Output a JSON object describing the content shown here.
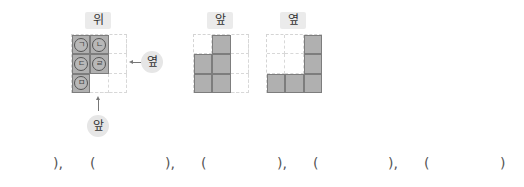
{
  "views": {
    "top": {
      "label": "위",
      "grid": [
        [
          {
            "filled": true,
            "mark": "ㄱ"
          },
          {
            "filled": true,
            "mark": "ㄴ"
          },
          {
            "filled": false,
            "mark": ""
          }
        ],
        [
          {
            "filled": true,
            "mark": "ㄷ"
          },
          {
            "filled": true,
            "mark": "ㄹ"
          },
          {
            "filled": false,
            "mark": ""
          }
        ],
        [
          {
            "filled": true,
            "mark": "ㅁ"
          },
          {
            "filled": false,
            "mark": ""
          },
          {
            "filled": false,
            "mark": ""
          }
        ]
      ],
      "side_pointer_label": "옆",
      "front_pointer_label": "앞"
    },
    "front": {
      "label": "앞",
      "grid": [
        [
          false,
          true,
          false
        ],
        [
          true,
          true,
          false
        ],
        [
          true,
          true,
          false
        ]
      ]
    },
    "side": {
      "label": "옆",
      "grid": [
        [
          false,
          false,
          true
        ],
        [
          false,
          false,
          true
        ],
        [
          true,
          true,
          true
        ]
      ]
    }
  },
  "answers": {
    "items": [
      {
        "close": "),",
        "mark": "ㄴ",
        "open": "("
      },
      {
        "close": "),",
        "mark": "ㄷ",
        "open": "("
      },
      {
        "close": "),",
        "mark": "ㄹ",
        "open": "("
      },
      {
        "close": "),",
        "mark": "ㅁ",
        "open": "("
      }
    ],
    "final_close": ")"
  },
  "colors": {
    "cell_fill": "#b0b0b0",
    "cell_border": "#7d7d7d",
    "label_bg": "#ebebeb",
    "grid_dash": "#d4d4d4"
  }
}
